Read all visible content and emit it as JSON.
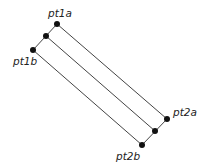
{
  "diagram": {
    "title": "",
    "points": [
      {
        "id": "pt1a",
        "label": "pt1a"
      },
      {
        "id": "mid1",
        "label": ""
      },
      {
        "id": "pt1b",
        "label": "pt1b"
      },
      {
        "id": "pt2a",
        "label": "pt2a"
      },
      {
        "id": "mid2",
        "label": ""
      },
      {
        "id": "pt2b",
        "label": "pt2b"
      }
    ],
    "segments": [
      {
        "from": "pt1a",
        "to": "pt2a"
      },
      {
        "from": "mid1",
        "to": "mid2"
      },
      {
        "from": "pt1b",
        "to": "pt2b"
      },
      {
        "from": "pt1a",
        "to": "pt1b"
      },
      {
        "from": "pt2a",
        "to": "pt2b"
      }
    ]
  }
}
